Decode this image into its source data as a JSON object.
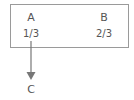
{
  "diagram": {
    "node_box": {
      "items": [
        {
          "label": "A",
          "value": "1/3"
        },
        {
          "label": "B",
          "value": "2/3"
        }
      ]
    },
    "target": {
      "label": "C"
    },
    "edge": {
      "from": "A",
      "to": "C",
      "direction": "down"
    },
    "colors": {
      "border": "#9a9a9a",
      "text": "#555555",
      "arrow": "#777777"
    }
  }
}
